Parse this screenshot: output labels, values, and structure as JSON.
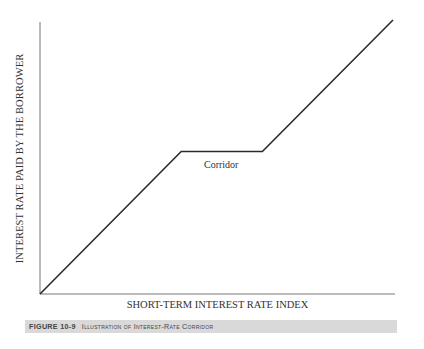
{
  "chart_data": {
    "type": "line",
    "title": "Illustration of Interest-Rate Corridor",
    "xlabel": "SHORT-TERM INTEREST RATE INDEX",
    "ylabel": "INTEREST RATE PAID BY THE BORROWER",
    "x_ticks": [],
    "y_ticks": [],
    "grid": false,
    "legend": null,
    "series": [
      {
        "name": "Borrower rate",
        "x": [
          0,
          0.4,
          0.63,
          1.0
        ],
        "y": [
          0,
          0.52,
          0.52,
          1.0
        ]
      }
    ],
    "annotations": [
      {
        "text": "Corridor",
        "position": "below flat segment"
      }
    ]
  },
  "figure": {
    "number": "FIGURE 10-9",
    "caption": "Illustration of Interest-Rate Corridor"
  },
  "colors": {
    "line": "#2b2b2b",
    "axis": "#555555",
    "caption_bg": "#d9d9d9"
  }
}
